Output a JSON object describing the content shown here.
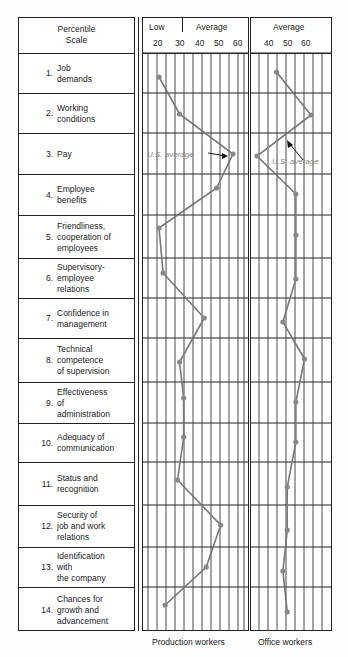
{
  "chart_data": {
    "type": "line",
    "title": "Percentile Scale",
    "orientation": "horizontal-profile",
    "categories": [
      "1. Job demands",
      "2. Working conditions",
      "3. Pay",
      "4. Employee benefits",
      "5. Friendliness, cooperation of employees",
      "6. Supervisory-employee relations",
      "7. Confidence in management",
      "8. Technical competence of supervision",
      "9. Effectiveness of administration",
      "10. Adequacy of communication",
      "11. Status and recognition",
      "12. Security of job and work relations",
      "13. Identification with the company",
      "14. Chances for growth and advancement"
    ],
    "series": [
      {
        "name": "Production workers",
        "xlabel_top": [
          "Low",
          "Average"
        ],
        "ticks": [
          20,
          30,
          40,
          50,
          60
        ],
        "xlim": [
          15,
          63
        ],
        "values": [
          21,
          31,
          57,
          49,
          21,
          23,
          43,
          31,
          33,
          33,
          30,
          51,
          44,
          24
        ],
        "annotation": {
          "text": "U.S. average",
          "row": 3
        }
      },
      {
        "name": "Office workers",
        "xlabel_top": [
          "Average"
        ],
        "ticks": [
          40,
          50,
          60
        ],
        "xlim": [
          31,
          72
        ],
        "values": [
          46,
          62,
          37,
          55,
          55,
          55,
          49,
          59,
          55,
          55,
          51,
          51,
          49,
          51
        ],
        "annotation": {
          "text": "U.S. average",
          "row": 3
        }
      }
    ],
    "grid": true,
    "line_color": "#777777",
    "marker_color": "#888888"
  },
  "labels_panel": {
    "header": "Percentile\nScale",
    "rows": [
      {
        "num": "1.",
        "text": "Job\ndemands"
      },
      {
        "num": "2.",
        "text": "Working\nconditions"
      },
      {
        "num": "3.",
        "text": "Pay"
      },
      {
        "num": "4.",
        "text": "Employee\nbenefits"
      },
      {
        "num": "5.",
        "text": "Friendliness,\ncooperation of\nemployees"
      },
      {
        "num": "6.",
        "text": "Supervisory-\nemployee\nrelations"
      },
      {
        "num": "7.",
        "text": "Confidence in\nmanagement"
      },
      {
        "num": "8.",
        "text": "Technical\ncompetence\nof supervision"
      },
      {
        "num": "9.",
        "text": "Effectiveness\nof\nadministration"
      },
      {
        "num": "10.",
        "text": "Adequacy of\ncommunication"
      },
      {
        "num": "11.",
        "text": "Status and\nrecognition"
      },
      {
        "num": "12.",
        "text": "Security of\njob and work\nrelations"
      },
      {
        "num": "13.",
        "text": "Identification\nwith\nthe company"
      },
      {
        "num": "14.",
        "text": "Chances for\ngrowth and\nadvancement"
      }
    ]
  },
  "production_panel": {
    "low_label": "Low",
    "average_label": "Average",
    "ticks": [
      "20",
      "30",
      "40",
      "50",
      "60"
    ],
    "us_average_label": "U.S. average",
    "caption": "Production workers"
  },
  "office_panel": {
    "average_label": "Average",
    "ticks": [
      "40",
      "50",
      "60"
    ],
    "us_average_label": "U.S. average",
    "caption": "Office workers"
  }
}
